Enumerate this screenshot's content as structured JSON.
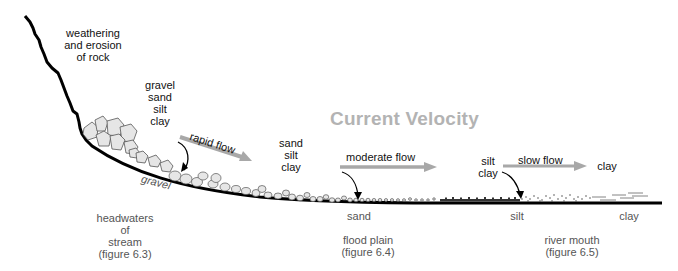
{
  "title": "Current Velocity",
  "source_label": "weathering\nand erosion\nof rock",
  "load_labels": {
    "headwaters": "gravel\nsand\nsilt\nclay",
    "flood_plain": "sand\nsilt\nclay",
    "river_mouth": "silt\nclay",
    "offshore": "clay"
  },
  "flows": [
    {
      "label": "rapid flow"
    },
    {
      "label": "moderate flow"
    },
    {
      "label": "slow flow"
    }
  ],
  "deposit_labels": {
    "gravel": "gravel",
    "sand": "sand",
    "silt": "silt",
    "clay": "clay"
  },
  "regions": [
    {
      "label": "headwaters\nof\nstream\n(figure 6.3)"
    },
    {
      "label": "flood plain\n(figure 6.4)"
    },
    {
      "label": "river mouth\n(figure 6.5)"
    }
  ],
  "colors": {
    "title": "#b3b3b3",
    "arrow": "#a8a8a8",
    "sediment_fill": "#e6e6e6",
    "sediment_stroke": "#555555",
    "ground": "#000000"
  }
}
